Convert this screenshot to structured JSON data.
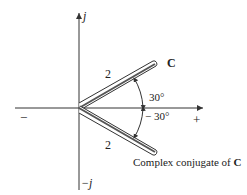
{
  "diagram": {
    "axes": {
      "imag_pos": "j",
      "imag_neg": "−j",
      "real_neg": "−",
      "real_pos": "+"
    },
    "phasor": {
      "label": "C",
      "magnitude": "2",
      "angle": "30°"
    },
    "conjugate": {
      "label_prefix": "Complex conjugate of ",
      "label_bold": "C",
      "magnitude": "2",
      "angle": "− 30°"
    },
    "colors": {
      "line": "#333333",
      "fill": "#ffffff",
      "shade": "#555555"
    }
  }
}
